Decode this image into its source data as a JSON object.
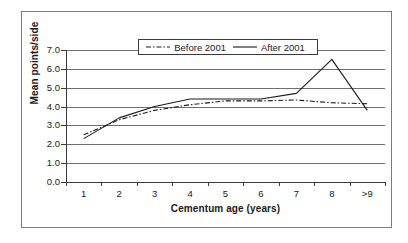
{
  "chart_data": {
    "type": "line",
    "title": "",
    "xlabel": "Cementum age (years)",
    "ylabel": "Mean points/side",
    "categories": [
      "1",
      "2",
      "3",
      "4",
      "5",
      "6",
      "7",
      "8",
      ">9"
    ],
    "ylim": [
      0.0,
      7.0
    ],
    "ytick_labels": [
      "0.0",
      "1.0",
      "2.0",
      "3.0",
      "4.0",
      "5.0",
      "6.0",
      "7.0"
    ],
    "ytick_values": [
      0.0,
      1.0,
      2.0,
      3.0,
      4.0,
      5.0,
      6.0,
      7.0
    ],
    "grid": "horizontal",
    "legend_position": "top-center",
    "series": [
      {
        "name": "Before 2001",
        "style": "dash-dot",
        "color": "#1a1a1a",
        "values": [
          2.5,
          3.3,
          3.8,
          4.1,
          4.3,
          4.3,
          4.35,
          4.2,
          4.15
        ]
      },
      {
        "name": "After 2001",
        "style": "solid",
        "color": "#1a1a1a",
        "values": [
          2.3,
          3.4,
          4.0,
          4.4,
          4.4,
          4.4,
          4.7,
          6.5,
          3.8
        ]
      }
    ]
  },
  "figure": {
    "border_color": "#7b7b7b",
    "axis_color": "#3a3a3a",
    "grid_color": "#6f6f6f",
    "background": "#ffffff"
  }
}
